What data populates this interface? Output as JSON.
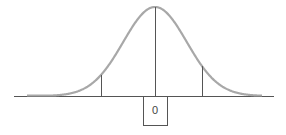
{
  "diagram": {
    "type": "normal-distribution-curve",
    "center_label": "0",
    "colors": {
      "curve": "#a8a8a8",
      "lines": "#555555",
      "background": "#ffffff"
    },
    "geometry": {
      "baseline_y": 96,
      "baseline_x_start": 14,
      "baseline_x_end": 274,
      "center_x": 155,
      "peak_y": 7,
      "sigma_px": 31.8,
      "curve_x_start": 27,
      "curve_x_end": 262,
      "left_marker_x": 101,
      "right_marker_x": 202,
      "label_box": {
        "x": 143,
        "y": 96,
        "width": 24,
        "height": 29
      }
    }
  }
}
